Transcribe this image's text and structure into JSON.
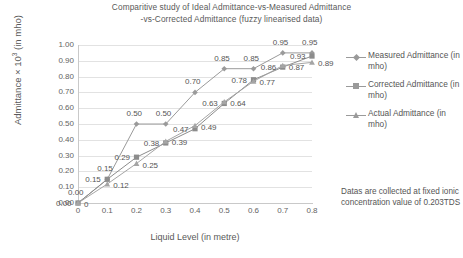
{
  "chart_data": {
    "type": "line",
    "title": "Comparitive study of Ideal Admittance-vs-Measured Admittance -vs-Corrected  Admittance (fuzzy  linearised data)",
    "title_line1": "Comparitive study of Ideal Admittance-vs-Measured Admittance",
    "title_line2": "-vs-Corrected  Admittance (fuzzy  linearised data)",
    "xlabel": "Liquid  Level (in metre)",
    "ylabel_prefix": "Admittance × 10",
    "ylabel_sup": "3",
    "ylabel_suffix": " (in mho)",
    "x": [
      0,
      0.1,
      0.2,
      0.3,
      0.4,
      0.5,
      0.6,
      0.7,
      0.8
    ],
    "xtick_labels": [
      "0",
      "0.1",
      "0.2",
      "0.3",
      "0.4",
      "0.5",
      "0.6",
      "0.7",
      "0.8"
    ],
    "ytick_labels": [
      "0.00",
      "0.10",
      "0.20",
      "0.30",
      "0.40",
      "0.50",
      "0.60",
      "0.70",
      "0.80",
      "0.90",
      "1.00"
    ],
    "ytick_values": [
      0.0,
      0.1,
      0.2,
      0.3,
      0.4,
      0.5,
      0.6,
      0.7,
      0.8,
      0.9,
      1.0
    ],
    "xlim": [
      0,
      0.8
    ],
    "ylim": [
      0,
      1.0
    ],
    "grid": true,
    "legend_position": "right",
    "series": [
      {
        "name": "Measured Admittance (in mho)",
        "marker": "diamond",
        "color": "#9a9a9a",
        "values": [
          0.0,
          0.15,
          0.5,
          0.5,
          0.7,
          0.85,
          0.85,
          0.95,
          0.95
        ],
        "labels": [
          "0.00",
          "0.15",
          "0.50",
          "0.50",
          "0.70",
          "0.85",
          "0.85",
          "0.95",
          "0.95"
        ]
      },
      {
        "name": "Corrected Admittance (in mho)",
        "marker": "square",
        "color": "#8c8c8c",
        "values": [
          0.0,
          0.15,
          0.29,
          0.38,
          0.47,
          0.63,
          0.78,
          0.86,
          0.93
        ],
        "labels": [
          "0.00",
          "0.15",
          "0.29",
          "0.38",
          "0.47",
          "0.63",
          "0.78",
          "0.86",
          "0.93"
        ]
      },
      {
        "name": "Actual Admittance (in mho)",
        "marker": "triangle",
        "color": "#a5a5a5",
        "values": [
          0.0,
          0.12,
          0.25,
          0.39,
          0.49,
          0.64,
          0.77,
          0.87,
          0.89
        ],
        "labels": [
          "0",
          "0.12",
          "0.25",
          "0.39",
          "0.49",
          "0.64",
          "0.77",
          "0.87",
          "0.89"
        ]
      }
    ],
    "annotation": "Datas are collected at fixed  ionic concentration value of 0.203TDS"
  },
  "legend": {
    "items": [
      {
        "label": "Measured Admittance (in mho)",
        "marker": "diamond"
      },
      {
        "label": "Corrected Admittance (in mho)",
        "marker": "square"
      },
      {
        "label": "Actual Admittance (in mho)",
        "marker": "triangle"
      }
    ]
  },
  "note": {
    "text": "Datas are collected at fixed  ionic concentration value of 0.203TDS"
  }
}
